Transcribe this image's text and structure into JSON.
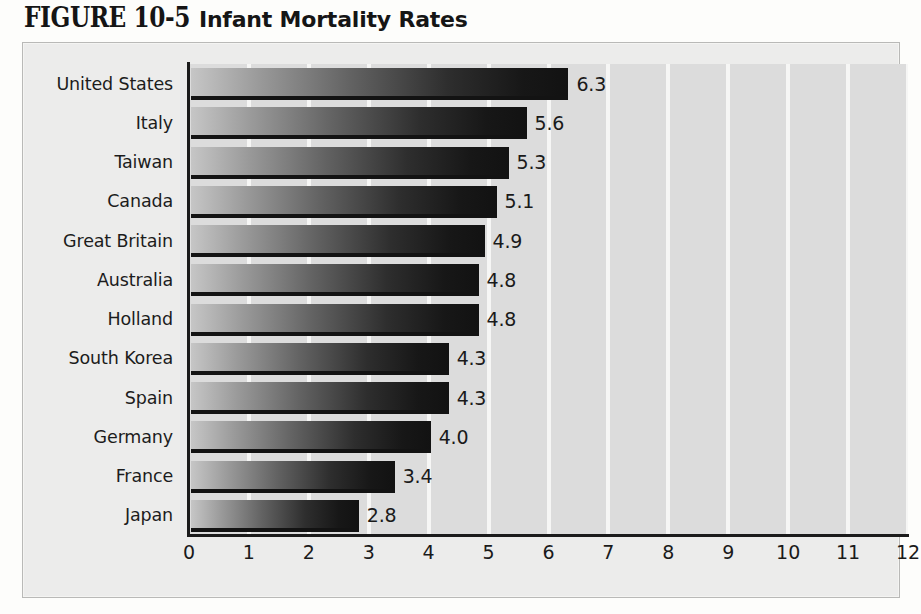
{
  "title": {
    "figure_label": "FIGURE 10-5",
    "figure_name": "Infant Mortality Rates"
  },
  "chart_data": {
    "type": "bar",
    "orientation": "horizontal",
    "title": "FIGURE 10-5 Infant Mortality Rates",
    "xlabel": "",
    "ylabel": "",
    "xlim": [
      0,
      12
    ],
    "xticks": [
      "0",
      "1",
      "2",
      "3",
      "4",
      "5",
      "6",
      "7",
      "8",
      "9",
      "10",
      "11",
      "12"
    ],
    "grid": true,
    "legend": "none",
    "categories": [
      "United States",
      "Italy",
      "Taiwan",
      "Canada",
      "Great Britain",
      "Australia",
      "Holland",
      "South Korea",
      "Spain",
      "Germany",
      "France",
      "Japan"
    ],
    "values": [
      6.3,
      5.6,
      5.3,
      5.1,
      4.9,
      4.8,
      4.8,
      4.3,
      4.3,
      4.0,
      3.4,
      2.8
    ],
    "value_labels": [
      "6.3",
      "5.6",
      "5.3",
      "5.1",
      "4.9",
      "4.8",
      "4.8",
      "4.3",
      "4.3",
      "4.0",
      "3.4",
      "2.8"
    ]
  },
  "colors": {
    "panel_background": "#ececeb",
    "plot_background": "#dcdcdc",
    "gridline": "#f6f6f5",
    "axis": "#1b1b1b",
    "bar_light": "#c6c6c6",
    "bar_dark": "#121212",
    "text": "#1a1a1a"
  }
}
